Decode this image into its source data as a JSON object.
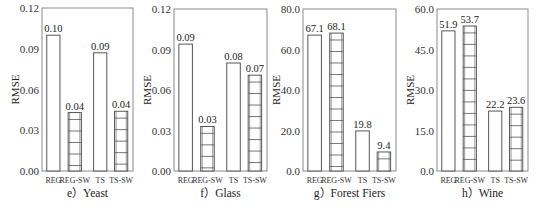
{
  "chart_data": [
    {
      "type": "bar",
      "caption": "e）Yeast",
      "ylabel": "RMSE",
      "ylim": [
        0,
        0.12
      ],
      "yticks": [
        "0.00",
        "0.03",
        "0.06",
        "0.09",
        "0.12"
      ],
      "categories": [
        "REG",
        "REG-SW",
        "TS",
        "TS-SW"
      ],
      "values": [
        0.1,
        0.043,
        0.087,
        0.044
      ],
      "labels": [
        "0.10",
        "0.04",
        "0.09",
        "0.04"
      ],
      "hatched": [
        false,
        true,
        false,
        true
      ],
      "frame": {
        "x": 42,
        "y": 8,
        "w": 91,
        "h": 163
      }
    },
    {
      "type": "bar",
      "caption": "f）Glass",
      "ylabel": "RMSE",
      "ylim": [
        0,
        0.12
      ],
      "yticks": [
        "0.00",
        "0.03",
        "0.06",
        "0.09",
        "0.12"
      ],
      "categories": [
        "REG",
        "REG-SW",
        "TS",
        "TS-SW"
      ],
      "values": [
        0.094,
        0.033,
        0.08,
        0.071
      ],
      "labels": [
        "0.09",
        "0.03",
        "0.08",
        "0.07"
      ],
      "hatched": [
        false,
        true,
        false,
        true
      ],
      "frame": {
        "x": 174,
        "y": 9,
        "w": 93,
        "h": 162
      }
    },
    {
      "type": "bar",
      "caption": "g）Forest Fiers",
      "ylabel": "RMSE",
      "ylim": [
        0,
        80
      ],
      "yticks": [
        "0.0",
        "20.0",
        "40.0",
        "60.0",
        "80.0"
      ],
      "categories": [
        "REG",
        "REG-SW",
        "TS",
        "TS-SW"
      ],
      "values": [
        67.1,
        68.1,
        19.8,
        9.4
      ],
      "labels": [
        "67.1",
        "68.1",
        "19.8",
        "9.4"
      ],
      "hatched": [
        false,
        true,
        false,
        true
      ],
      "frame": {
        "x": 303,
        "y": 9,
        "w": 93,
        "h": 162
      }
    },
    {
      "type": "bar",
      "caption": "h）Wine",
      "ylabel": "RMSE",
      "ylim": [
        0,
        60
      ],
      "yticks": [
        "0.0",
        "15.0",
        "30.0",
        "45.0",
        "60.0"
      ],
      "categories": [
        "REG",
        "REG-SW",
        "TS",
        "TS-SW"
      ],
      "values": [
        51.9,
        53.7,
        22.2,
        23.6
      ],
      "labels": [
        "51.9",
        "53.7",
        "22.2",
        "23.6"
      ],
      "hatched": [
        false,
        true,
        false,
        true
      ],
      "frame": {
        "x": 437,
        "y": 9,
        "w": 91,
        "h": 162
      }
    }
  ],
  "colors": {
    "frame": "#8a8a8a",
    "bar_stroke": "#444444",
    "bar_fill": "#ffffff",
    "hatch": "#555555"
  }
}
